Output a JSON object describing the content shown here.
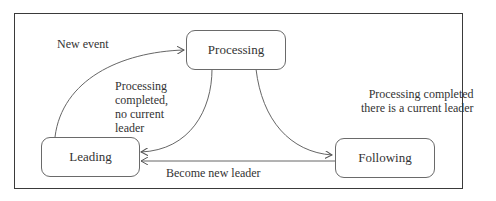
{
  "diagram": {
    "type": "state-machine",
    "nodes": [
      {
        "id": "processing",
        "label": "Processing"
      },
      {
        "id": "leading",
        "label": "Leading"
      },
      {
        "id": "following",
        "label": "Following"
      }
    ],
    "edges": [
      {
        "from": "leading",
        "to": "processing",
        "label": "New event"
      },
      {
        "from": "processing",
        "to": "leading",
        "label_lines": [
          "Processing",
          "completed,",
          "no current",
          "leader"
        ]
      },
      {
        "from": "processing",
        "to": "following",
        "label_lines": [
          "Processing completed",
          "there is a current leader"
        ]
      },
      {
        "from": "following",
        "to": "leading",
        "label": "Become new leader"
      }
    ]
  }
}
